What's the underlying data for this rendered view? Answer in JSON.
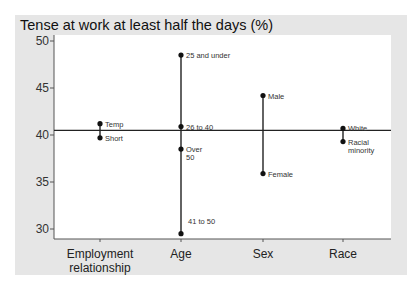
{
  "chart_data": {
    "type": "scatter",
    "title": "Tense at work at least half the days (%)",
    "xlabel": "",
    "ylabel": "",
    "ylim": [
      29,
      51
    ],
    "yticks": [
      30,
      35,
      40,
      45,
      50
    ],
    "grid": false,
    "reference_line": 40.5,
    "categories": [
      "Employment relationship",
      "Age",
      "Sex",
      "Race"
    ],
    "category_lines": [
      [
        "Employment",
        "relationship"
      ],
      [
        "Age"
      ],
      [
        "Sex"
      ],
      [
        "Race"
      ]
    ],
    "series": [
      {
        "category": "Employment relationship",
        "points": [
          {
            "label": "Temp",
            "value": 41.2
          },
          {
            "label": "Short",
            "value": 39.7
          }
        ]
      },
      {
        "category": "Age",
        "points": [
          {
            "label": "25 and under",
            "value": 48.5
          },
          {
            "label": "26 to 40",
            "value": 40.9
          },
          {
            "label": "Over 50",
            "value": 38.5
          },
          {
            "label": "41 to 50",
            "value": 29.5
          }
        ]
      },
      {
        "category": "Sex",
        "points": [
          {
            "label": "Male",
            "value": 44.2
          },
          {
            "label": "Female",
            "value": 35.9
          }
        ]
      },
      {
        "category": "Race",
        "points": [
          {
            "label": "White",
            "value": 40.7
          },
          {
            "label": "Racial minority",
            "value": 39.3
          }
        ]
      }
    ]
  }
}
